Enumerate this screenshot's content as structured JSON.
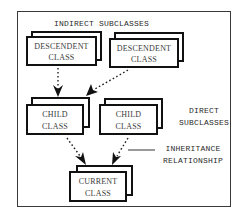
{
  "diagram": {
    "title_label": "INDIRECT SUBCLASSES",
    "direct_label": {
      "line1": "DIRECT",
      "line2": "SUBCLASSES"
    },
    "relationship_label": {
      "line1": "INHERITANCE",
      "line2": "RELATIONSHIP"
    },
    "nodes": [
      {
        "id": "descendent-1",
        "line1": "DESCENDENT",
        "line2": "CLASS"
      },
      {
        "id": "descendent-2",
        "line1": "DESCENDENT",
        "line2": "CLASS"
      },
      {
        "id": "child-1",
        "line1": "CHILD",
        "line2": "CLASS"
      },
      {
        "id": "child-2",
        "line1": "CHILD",
        "line2": "CLASS"
      },
      {
        "id": "current",
        "line1": "CURRENT",
        "line2": "CLASS"
      }
    ],
    "edges": [
      {
        "from": "descendent-1",
        "to": "child-1",
        "style": "dotted-arrow"
      },
      {
        "from": "descendent-2",
        "to": "child-1",
        "style": "dotted-arrow"
      },
      {
        "from": "child-1",
        "to": "current",
        "style": "dotted-arrow"
      },
      {
        "from": "child-2",
        "to": "current",
        "style": "dotted-arrow"
      }
    ],
    "colors": {
      "stroke": "#111111",
      "text": "#2a2a2a",
      "background": "#ffffff"
    }
  }
}
